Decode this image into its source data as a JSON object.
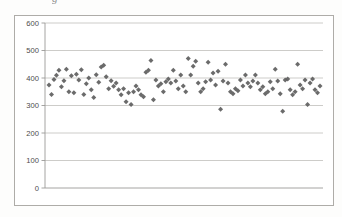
{
  "page": {
    "background": "#fdfdfc",
    "caption_fragment": "g"
  },
  "chart": {
    "frame_border_color": "#aeaca8",
    "plot_background": "#ffffff"
  },
  "chart_data": {
    "type": "scatter",
    "title": "",
    "xlabel": "",
    "ylabel": "",
    "x_axis_labels_visible": false,
    "ylim": [
      0,
      600
    ],
    "y_ticks": [
      0,
      100,
      200,
      300,
      400,
      500,
      600
    ],
    "grid": true,
    "legend": "none",
    "gridline_color": "#c7c6c3",
    "axis_color": "#9b9a97",
    "tick_label_color": "#4d4c4a",
    "marker": {
      "shape": "diamond",
      "color": "#5e5e5e",
      "size_px": 5
    },
    "n_points": 110,
    "values": [
      375,
      340,
      395,
      410,
      428,
      368,
      390,
      432,
      350,
      408,
      346,
      414,
      393,
      430,
      340,
      379,
      400,
      357,
      329,
      412,
      385,
      440,
      446,
      405,
      361,
      390,
      370,
      382,
      357,
      339,
      361,
      314,
      346,
      304,
      350,
      371,
      357,
      339,
      332,
      421,
      428,
      464,
      321,
      393,
      371,
      379,
      350,
      386,
      396,
      382,
      428,
      389,
      361,
      411,
      371,
      350,
      471,
      411,
      443,
      461,
      382,
      350,
      361,
      386,
      457,
      393,
      418,
      375,
      425,
      286,
      389,
      450,
      382,
      350,
      343,
      361,
      354,
      393,
      371,
      411,
      382,
      368,
      389,
      411,
      382,
      357,
      368,
      343,
      350,
      386,
      361,
      432,
      389,
      343,
      279,
      393,
      396,
      357,
      339,
      350,
      450,
      375,
      361,
      393,
      304,
      382,
      396,
      357,
      346,
      371
    ]
  }
}
